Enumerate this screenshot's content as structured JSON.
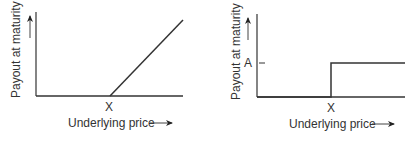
{
  "diagrams": [
    {
      "id": "call-payoff",
      "y_axis_label": "Payout at maturity",
      "x_axis_label": "Underlying price",
      "x_marker": "X",
      "shape": "hockey-stick: zero until X, then linear increase"
    },
    {
      "id": "binary-payoff",
      "y_axis_label": "Payout at maturity",
      "x_axis_label": "Underlying price",
      "x_marker": "X",
      "y_marker": "A",
      "shape": "step: zero until X, then constant A"
    }
  ],
  "colors": {
    "line": "#333333",
    "background": "#ffffff"
  }
}
